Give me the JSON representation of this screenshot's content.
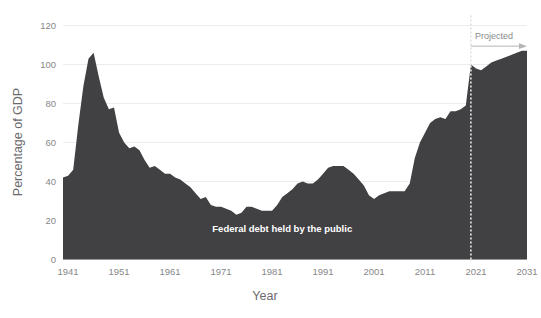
{
  "chart_data": {
    "type": "area",
    "title": "",
    "xlabel": "Year",
    "ylabel": "Percentage of GDP",
    "xlim": [
      1940,
      2031
    ],
    "ylim": [
      0,
      120
    ],
    "yticks": [
      0,
      20,
      40,
      60,
      80,
      100,
      120
    ],
    "xticks": [
      1941,
      1951,
      1961,
      1971,
      1981,
      1991,
      2001,
      2011,
      2021,
      2031
    ],
    "grid": true,
    "legend_position": "none",
    "series_label": "Federal debt held by the public",
    "series_label_x": 1983,
    "series_label_y": 14,
    "fill_color": "#414144",
    "grid_color": "#ececee",
    "tick_color": "#878789",
    "projection_divider_year": 2020,
    "annotations": [
      {
        "name": "projected",
        "text": "Projected",
        "x_start": 2020,
        "x_end": 2031,
        "y": 113
      }
    ],
    "x": [
      1940,
      1941,
      1942,
      1943,
      1944,
      1945,
      1946,
      1947,
      1948,
      1949,
      1950,
      1951,
      1952,
      1953,
      1954,
      1955,
      1956,
      1957,
      1958,
      1959,
      1960,
      1961,
      1962,
      1963,
      1964,
      1965,
      1966,
      1967,
      1968,
      1969,
      1970,
      1971,
      1972,
      1973,
      1974,
      1975,
      1976,
      1977,
      1978,
      1979,
      1980,
      1981,
      1982,
      1983,
      1984,
      1985,
      1986,
      1987,
      1988,
      1989,
      1990,
      1991,
      1992,
      1993,
      1994,
      1995,
      1996,
      1997,
      1998,
      1999,
      2000,
      2001,
      2002,
      2003,
      2004,
      2005,
      2006,
      2007,
      2008,
      2009,
      2010,
      2011,
      2012,
      2013,
      2014,
      2015,
      2016,
      2017,
      2018,
      2019,
      2020,
      2021,
      2022,
      2023,
      2024,
      2025,
      2026,
      2027,
      2028,
      2029,
      2030,
      2031
    ],
    "values": [
      42,
      43,
      46,
      69,
      89,
      103,
      106,
      94,
      83,
      77,
      78,
      65,
      60,
      57,
      58,
      56,
      51,
      47,
      48,
      46,
      44,
      44,
      42,
      41,
      39,
      37,
      34,
      31,
      32,
      28,
      27,
      27,
      26,
      25,
      23,
      24,
      27,
      27,
      26,
      25,
      25,
      25,
      28,
      32,
      34,
      36,
      39,
      40,
      39,
      39,
      41,
      44,
      47,
      48,
      48,
      48,
      46,
      44,
      41,
      38,
      33,
      31,
      33,
      34,
      35,
      35,
      35,
      35,
      39,
      52,
      60,
      65,
      70,
      72,
      73,
      72,
      76,
      76,
      77,
      79,
      100,
      98,
      97,
      99,
      101,
      102,
      103,
      104,
      105,
      106,
      107,
      107
    ],
    "history_end_index": 80,
    "units": "Percentage of GDP"
  },
  "axis": {
    "y_title": "Percentage of GDP",
    "x_title": "Year",
    "y_tick_labels": [
      "0",
      "20",
      "40",
      "60",
      "80",
      "100",
      "120"
    ],
    "x_tick_labels": [
      "1941",
      "1951",
      "1961",
      "1971",
      "1981",
      "1991",
      "2001",
      "2011",
      "2021",
      "2031"
    ]
  },
  "annotation": {
    "projected_label": "Projected",
    "series_label": "Federal debt held by the public"
  }
}
